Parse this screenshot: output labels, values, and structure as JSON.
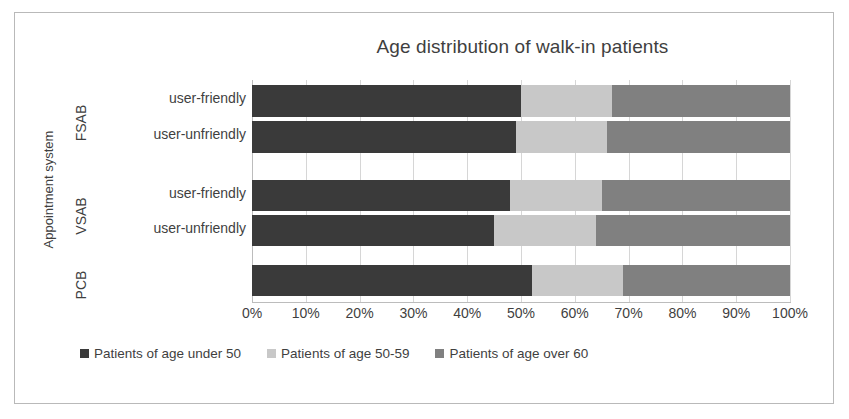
{
  "chart_data": {
    "type": "bar",
    "orientation": "horizontal",
    "stacked": true,
    "stack_mode": "percent",
    "title": "Age distribution of walk-in patients",
    "xlabel": "",
    "ylabel": "Appointment system",
    "xlim": [
      0,
      100
    ],
    "x_tick_labels": [
      "0%",
      "10%",
      "20%",
      "30%",
      "40%",
      "50%",
      "60%",
      "70%",
      "80%",
      "90%",
      "100%"
    ],
    "x_ticks": [
      0,
      10,
      20,
      30,
      40,
      50,
      60,
      70,
      80,
      90,
      100
    ],
    "grid": true,
    "legend_position": "bottom",
    "groups": [
      {
        "name": "FSAB",
        "categories": [
          "user-friendly",
          "user-unfriendly"
        ]
      },
      {
        "name": "VSAB",
        "categories": [
          "user-friendly",
          "user-unfriendly"
        ]
      },
      {
        "name": "PCB",
        "categories": [
          ""
        ]
      }
    ],
    "categories": [
      "FSAB / user-friendly",
      "FSAB / user-unfriendly",
      "VSAB / user-friendly",
      "VSAB / user-unfriendly",
      "PCB"
    ],
    "series": [
      {
        "name": "Patients of age under 50",
        "color": "#3a3a3a",
        "values": [
          50,
          49,
          48,
          45,
          52
        ]
      },
      {
        "name": "Patients of age 50-59",
        "color": "#c8c8c8",
        "values": [
          17,
          17,
          17,
          19,
          17
        ]
      },
      {
        "name": "Patients of age over 60",
        "color": "#808080",
        "values": [
          33,
          34,
          35,
          36,
          31
        ]
      }
    ]
  },
  "legend": {
    "items": [
      {
        "label": "Patients of age under 50",
        "color": "#3a3a3a"
      },
      {
        "label": "Patients of age 50-59",
        "color": "#c8c8c8"
      },
      {
        "label": "Patients of age over 60",
        "color": "#808080"
      }
    ]
  },
  "axis": {
    "y_title": "Appointment system"
  },
  "bar_layout": [
    {
      "top": 5,
      "height": 32,
      "cat_label": "user-friendly",
      "cat_top": 90
    },
    {
      "top": 41,
      "height": 32,
      "cat_label": "user-unfriendly",
      "cat_top": 126
    },
    {
      "top": 100,
      "height": 31,
      "cat_label": "user-friendly",
      "cat_top": 185
    },
    {
      "top": 135,
      "height": 31,
      "cat_label": "user-unfriendly",
      "cat_top": 220
    },
    {
      "top": 185,
      "height": 31,
      "cat_label": "",
      "cat_top": 270
    }
  ]
}
